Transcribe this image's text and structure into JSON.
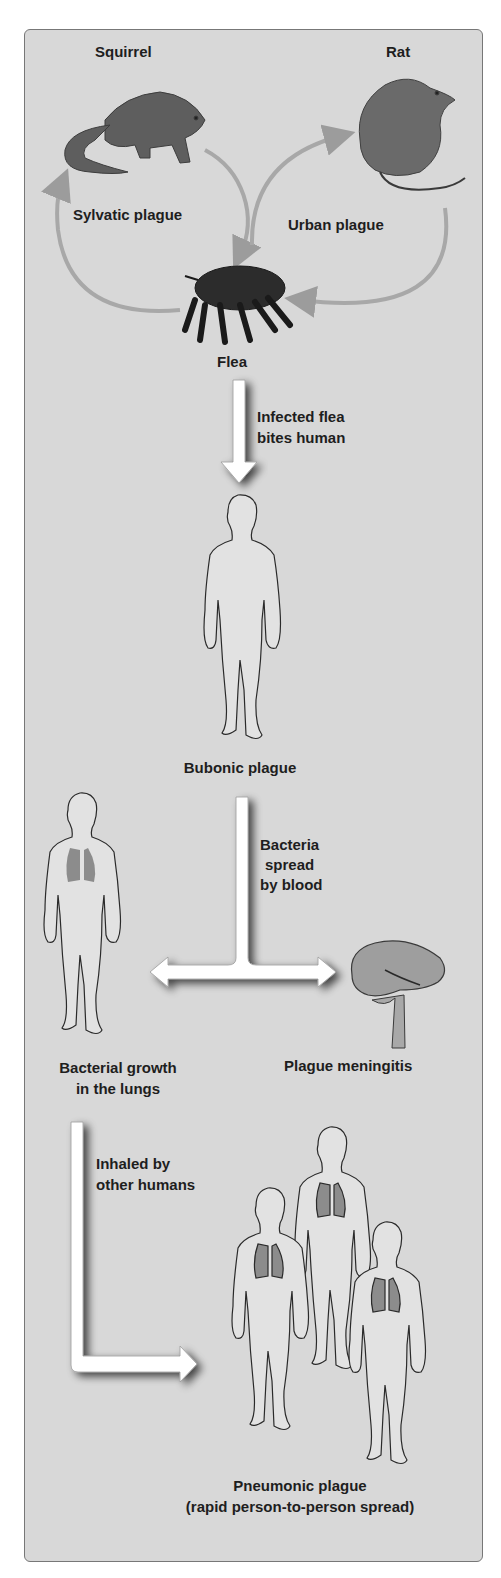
{
  "diagram": {
    "background_color": "#d8d8d8",
    "arrow_color": "#ffffff",
    "cycle_arrow_color": "#a6a6a6",
    "lung_color": "#8c8c8c",
    "reservoirs": {
      "squirrel_label": "Squirrel",
      "rat_label": "Rat",
      "sylvatic_label": "Sylvatic plague",
      "urban_label": "Urban plague",
      "vector_label": "Flea"
    },
    "steps": {
      "flea_bite_line1": "Infected flea",
      "flea_bite_line2": "bites human",
      "bubonic_label": "Bubonic plague",
      "blood_line1": "Bacteria",
      "blood_line2": "spread",
      "blood_line3": "by blood",
      "lungs_line1": "Bacterial growth",
      "lungs_line2": "in the lungs",
      "meningitis_label": "Plague meningitis",
      "inhaled_line1": "Inhaled by",
      "inhaled_line2": "other humans",
      "pneumonic_line1": "Pneumonic plague",
      "pneumonic_line2": "(rapid person-to-person spread)"
    },
    "flow": [
      {
        "from": "Squirrel",
        "to": "Flea",
        "label": "Sylvatic plague"
      },
      {
        "from": "Flea",
        "to": "Squirrel",
        "label": "Sylvatic plague"
      },
      {
        "from": "Rat",
        "to": "Flea",
        "label": "Urban plague"
      },
      {
        "from": "Flea",
        "to": "Rat",
        "label": "Urban plague"
      },
      {
        "from": "Flea",
        "to": "Bubonic plague",
        "label": "Infected flea bites human"
      },
      {
        "from": "Bubonic plague",
        "to": "Bacterial growth in the lungs",
        "label": "Bacteria spread by blood"
      },
      {
        "from": "Bubonic plague",
        "to": "Plague meningitis",
        "label": "Bacteria spread by blood"
      },
      {
        "from": "Bacterial growth in the lungs",
        "to": "Pneumonic plague",
        "label": "Inhaled by other humans"
      }
    ]
  }
}
